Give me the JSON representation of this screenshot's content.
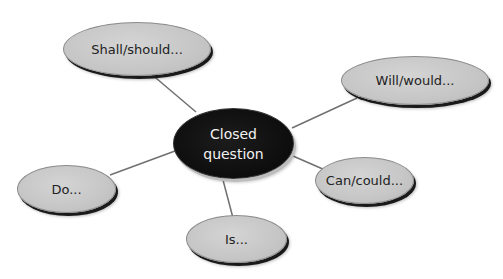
{
  "diagram": {
    "type": "mind-map",
    "center": {
      "label": "Closed\nquestion"
    },
    "nodes": [
      {
        "id": "shall",
        "label": "Shall/should..."
      },
      {
        "id": "will",
        "label": "Will/would..."
      },
      {
        "id": "can",
        "label": "Can/could..."
      },
      {
        "id": "is",
        "label": "Is..."
      },
      {
        "id": "do",
        "label": "Do..."
      }
    ],
    "edges": [
      {
        "from": "center",
        "to": "shall"
      },
      {
        "from": "center",
        "to": "will"
      },
      {
        "from": "center",
        "to": "can"
      },
      {
        "from": "center",
        "to": "is"
      },
      {
        "from": "center",
        "to": "do"
      }
    ],
    "colors": {
      "center_fill": "#0d0d0d",
      "center_text": "#f2f2f2",
      "leaf_fill": "#c6c6c6",
      "leaf_text": "#222222",
      "connector": "#707070"
    }
  }
}
